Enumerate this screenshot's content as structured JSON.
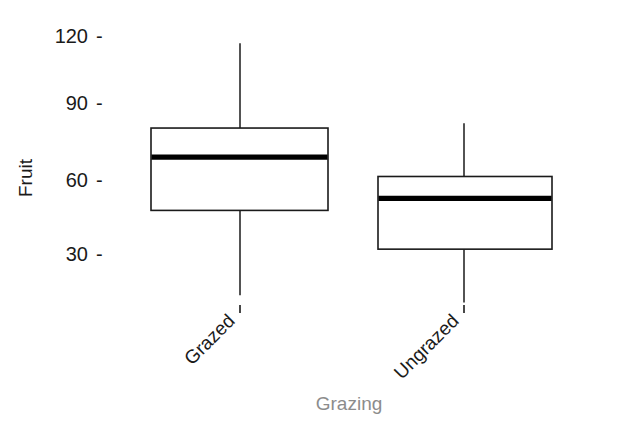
{
  "chart_data": {
    "type": "box",
    "title": "",
    "subtitle": "",
    "xlabel": "Grazing",
    "ylabel": "Fruit",
    "categories": [
      "Grazed",
      "Ungrazed"
    ],
    "ytick_labels": [
      "120",
      "90",
      "60",
      "30"
    ],
    "ytick_values": [
      120,
      90,
      60,
      30
    ],
    "ylim": [
      10,
      120
    ],
    "grid": false,
    "legend": null,
    "tick_dash": "-",
    "series": [
      {
        "name": "Grazed",
        "whisker_low": 13,
        "q1": 48,
        "median": 70,
        "q3": 82,
        "whisker_high": 117
      },
      {
        "name": "Ungrazed",
        "whisker_low": 10,
        "q1": 32,
        "median": 53,
        "q3": 62,
        "whisker_high": 84
      }
    ],
    "colors": {
      "box_fill": "#ffffff",
      "box_stroke": "#1a1a1a",
      "median": "#000000",
      "whisker": "#1a1a1a",
      "xlabel_color": "#8c8c8c",
      "ylabel_color": "#1a1a1a",
      "background": "#ffffff"
    },
    "geometry": {
      "boxes": [
        {
          "x_left": 151,
          "x_right": 328,
          "x_center": 240
        },
        {
          "x_left": 378,
          "x_right": 552,
          "x_center": 464
        }
      ],
      "y_pixels": {
        "tick_120": 36,
        "tick_90": 103,
        "tick_60": 180,
        "tick_30": 254
      }
    }
  }
}
